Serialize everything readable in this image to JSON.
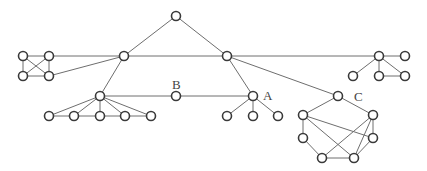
{
  "diagram": {
    "type": "graph",
    "node_radius": 4.5,
    "colors": {
      "edge": "#6e6e6e",
      "node_stroke": "#3a3a3a",
      "node_fill": "#ffffff",
      "label": "#444444"
    },
    "labels": [
      {
        "id": "B",
        "text": "B",
        "x": 172,
        "y": 89
      },
      {
        "id": "A",
        "text": "A",
        "x": 263,
        "y": 100
      },
      {
        "id": "C",
        "text": "C",
        "x": 354,
        "y": 101
      }
    ],
    "nodes": [
      {
        "id": "top",
        "x": 176,
        "y": 16
      },
      {
        "id": "hubL",
        "x": 124,
        "y": 56
      },
      {
        "id": "hubR",
        "x": 227,
        "y": 56
      },
      {
        "id": "k1",
        "x": 23,
        "y": 56
      },
      {
        "id": "k2",
        "x": 49,
        "y": 56
      },
      {
        "id": "k3",
        "x": 23,
        "y": 76
      },
      {
        "id": "k4",
        "x": 49,
        "y": 76
      },
      {
        "id": "fan",
        "x": 100,
        "y": 96
      },
      {
        "id": "f1",
        "x": 49,
        "y": 116
      },
      {
        "id": "f2",
        "x": 74,
        "y": 116
      },
      {
        "id": "f3",
        "x": 100,
        "y": 116
      },
      {
        "id": "f4",
        "x": 125,
        "y": 116
      },
      {
        "id": "f5",
        "x": 151,
        "y": 116
      },
      {
        "id": "B",
        "x": 176,
        "y": 96
      },
      {
        "id": "A",
        "x": 253,
        "y": 96
      },
      {
        "id": "a1",
        "x": 227,
        "y": 116
      },
      {
        "id": "a2",
        "x": 253,
        "y": 116
      },
      {
        "id": "a3",
        "x": 278,
        "y": 116
      },
      {
        "id": "r0",
        "x": 379,
        "y": 56
      },
      {
        "id": "r1",
        "x": 405,
        "y": 56
      },
      {
        "id": "r2",
        "x": 353,
        "y": 76
      },
      {
        "id": "r3",
        "x": 379,
        "y": 76
      },
      {
        "id": "r4",
        "x": 405,
        "y": 76
      },
      {
        "id": "C",
        "x": 338,
        "y": 96
      },
      {
        "id": "h1",
        "x": 303,
        "y": 115
      },
      {
        "id": "h2",
        "x": 373,
        "y": 115
      },
      {
        "id": "h3",
        "x": 303,
        "y": 138
      },
      {
        "id": "h4",
        "x": 373,
        "y": 138
      },
      {
        "id": "h5",
        "x": 322,
        "y": 158
      },
      {
        "id": "h6",
        "x": 354,
        "y": 158
      }
    ],
    "edges": [
      [
        "top",
        "hubL"
      ],
      [
        "top",
        "hubR"
      ],
      [
        "hubL",
        "hubR"
      ],
      [
        "hubR",
        "r0"
      ],
      [
        "k2",
        "hubL"
      ],
      [
        "k4",
        "hubL"
      ],
      [
        "k1",
        "k2"
      ],
      [
        "k1",
        "k3"
      ],
      [
        "k2",
        "k4"
      ],
      [
        "k3",
        "k4"
      ],
      [
        "k1",
        "k4"
      ],
      [
        "k2",
        "k3"
      ],
      [
        "hubL",
        "fan"
      ],
      [
        "fan",
        "f1"
      ],
      [
        "fan",
        "f2"
      ],
      [
        "fan",
        "f3"
      ],
      [
        "fan",
        "f4"
      ],
      [
        "fan",
        "f5"
      ],
      [
        "f1",
        "f2"
      ],
      [
        "f2",
        "f3"
      ],
      [
        "f3",
        "f4"
      ],
      [
        "f4",
        "f5"
      ],
      [
        "fan",
        "B"
      ],
      [
        "B",
        "A"
      ],
      [
        "hubR",
        "A"
      ],
      [
        "A",
        "a1"
      ],
      [
        "A",
        "a2"
      ],
      [
        "A",
        "a3"
      ],
      [
        "r0",
        "r1"
      ],
      [
        "r0",
        "r2"
      ],
      [
        "r0",
        "r3"
      ],
      [
        "r0",
        "r4"
      ],
      [
        "r3",
        "r4"
      ],
      [
        "hubR",
        "C"
      ],
      [
        "C",
        "h1"
      ],
      [
        "C",
        "h2"
      ],
      [
        "h1",
        "h3"
      ],
      [
        "h3",
        "h5"
      ],
      [
        "h5",
        "h6"
      ],
      [
        "h6",
        "h4"
      ],
      [
        "h4",
        "h2"
      ],
      [
        "h1",
        "h4"
      ],
      [
        "h1",
        "h6"
      ],
      [
        "h2",
        "h5"
      ],
      [
        "h2",
        "h6"
      ]
    ]
  }
}
